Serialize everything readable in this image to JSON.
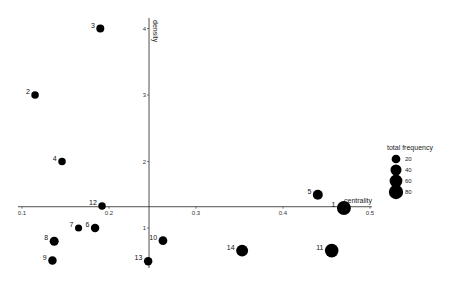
{
  "chart_data": {
    "type": "scatter",
    "title": "",
    "xlabel": "centrality",
    "ylabel": "density",
    "x_ticks": [
      "0.1",
      "0.2",
      "0.3",
      "0.4",
      "0.5"
    ],
    "y_ticks": [
      "1",
      "2",
      "3",
      "4"
    ],
    "xlim": [
      0.1,
      0.5
    ],
    "ylim": [
      0.5,
      4.0
    ],
    "axes_cross": {
      "x": 0.246,
      "y": 1.32
    },
    "grid": false,
    "legend": {
      "title": "total_frequency",
      "position": "right",
      "entries": [
        {
          "label": "20",
          "size": 20
        },
        {
          "label": "40",
          "size": 40
        },
        {
          "label": "60",
          "size": 60
        },
        {
          "label": "80",
          "size": 80
        }
      ]
    },
    "points": [
      {
        "label": "1",
        "x": 0.47,
        "y": 1.3,
        "freq": 75
      },
      {
        "label": "2",
        "x": 0.115,
        "y": 3.0,
        "freq": 12
      },
      {
        "label": "3",
        "x": 0.19,
        "y": 4.0,
        "freq": 15
      },
      {
        "label": "4",
        "x": 0.146,
        "y": 2.0,
        "freq": 12
      },
      {
        "label": "5",
        "x": 0.44,
        "y": 1.5,
        "freq": 30
      },
      {
        "label": "6",
        "x": 0.184,
        "y": 1.0,
        "freq": 18
      },
      {
        "label": "7",
        "x": 0.165,
        "y": 1.0,
        "freq": 10
      },
      {
        "label": "8",
        "x": 0.137,
        "y": 0.8,
        "freq": 22
      },
      {
        "label": "9",
        "x": 0.135,
        "y": 0.51,
        "freq": 18
      },
      {
        "label": "10",
        "x": 0.262,
        "y": 0.81,
        "freq": 20
      },
      {
        "label": "11",
        "x": 0.456,
        "y": 0.66,
        "freq": 70
      },
      {
        "label": "12",
        "x": 0.192,
        "y": 1.33,
        "freq": 12
      },
      {
        "label": "13",
        "x": 0.245,
        "y": 0.5,
        "freq": 18
      },
      {
        "label": "14",
        "x": 0.353,
        "y": 0.66,
        "freq": 50
      }
    ]
  }
}
